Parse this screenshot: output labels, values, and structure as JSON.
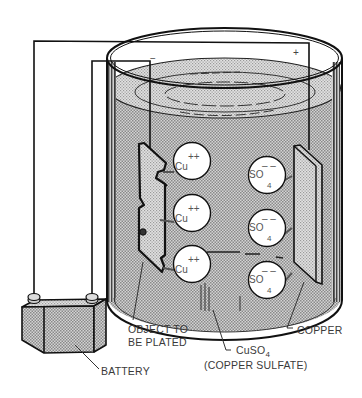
{
  "diagram": {
    "colors": {
      "ink": "#1a1a1a",
      "solution_fill": "#b8b8b8",
      "ion_fill": "#ffffff",
      "background": "#ffffff"
    },
    "terminals": {
      "negative": "−",
      "positive": "+"
    },
    "cation": {
      "symbol": "Cu",
      "charge": "++",
      "count": 3
    },
    "anion": {
      "symbol": "SO",
      "subscript": "4",
      "charge": "– –",
      "count": 3
    },
    "labels": {
      "object": [
        "OBJECT TO",
        "BE PLATED"
      ],
      "copper": "COPPER",
      "solution_formula": "CuSO",
      "solution_formula_sub": "4",
      "solution_name": "(COPPER SULFATE)",
      "battery": "BATTERY"
    }
  }
}
